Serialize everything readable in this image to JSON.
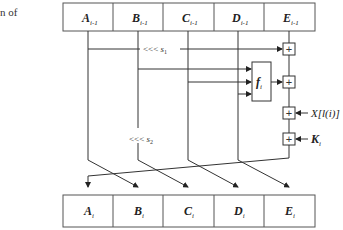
{
  "caption_fragment": "n of",
  "top_row": [
    {
      "var": "A",
      "sub": "i-1"
    },
    {
      "var": "B",
      "sub": "i-1"
    },
    {
      "var": "C",
      "sub": "i-1"
    },
    {
      "var": "D",
      "sub": "i-1"
    },
    {
      "var": "E",
      "sub": "i-1"
    }
  ],
  "bottom_row": [
    {
      "var": "A",
      "sub": "i"
    },
    {
      "var": "B",
      "sub": "i"
    },
    {
      "var": "C",
      "sub": "i"
    },
    {
      "var": "D",
      "sub": "i"
    },
    {
      "var": "E",
      "sub": "i"
    }
  ],
  "rotations": {
    "s1": {
      "op": "<<<",
      "var": "s",
      "sub": "1"
    },
    "s2": {
      "op": "<<<",
      "var": "s",
      "sub": "2"
    }
  },
  "function_box": {
    "var": "f",
    "sub": "i"
  },
  "adders": [
    "+",
    "+",
    "+",
    "+"
  ],
  "inputs": {
    "message": "X[l(i)]",
    "constant": {
      "var": "K",
      "sub": "i"
    }
  },
  "colors": {
    "line": "#333333",
    "box_border": "#555555",
    "background": "#ffffff"
  }
}
